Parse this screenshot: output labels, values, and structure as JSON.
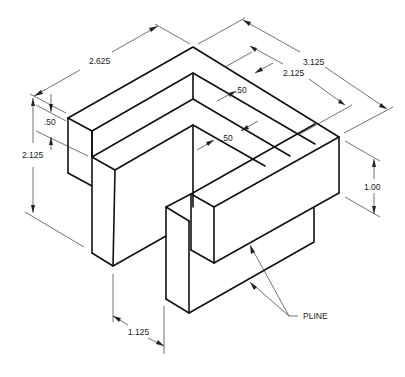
{
  "drawing": {
    "type": "isometric-technical-drawing",
    "units": "inches",
    "dimensions": [
      {
        "id": "overall-width-left",
        "label": "2.625"
      },
      {
        "id": "overall-width-right",
        "label": "3.125"
      },
      {
        "id": "inner-width-right",
        "label": "2.125"
      },
      {
        "id": "wall-thickness-top",
        "label": ".50"
      },
      {
        "id": "wall-thickness-inner",
        "label": ".50"
      },
      {
        "id": "wall-thickness-left",
        "label": ".50"
      },
      {
        "id": "overall-height",
        "label": "2.125"
      },
      {
        "id": "right-block-height",
        "label": "1.00"
      },
      {
        "id": "gap-width",
        "label": "1.125"
      }
    ],
    "callout": {
      "label": "PLINE",
      "leaders": 2
    },
    "colors": {
      "line": "#111111",
      "dimension": "#333333",
      "background": "#ffffff"
    }
  }
}
